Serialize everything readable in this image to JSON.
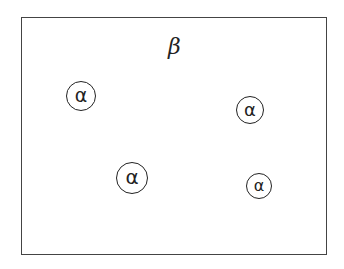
{
  "diagram": {
    "outer_region": {
      "label": "β",
      "x": 21,
      "y": 17,
      "w": 306,
      "h": 238
    },
    "beta_label": {
      "text": "β",
      "cx": 177,
      "cy": 49
    },
    "circles": [
      {
        "label": "α",
        "cx": 81,
        "cy": 96,
        "r": 15
      },
      {
        "label": "α",
        "cx": 250,
        "cy": 110,
        "r": 14
      },
      {
        "label": "α",
        "cx": 132,
        "cy": 178,
        "r": 16
      },
      {
        "label": "α",
        "cx": 259,
        "cy": 186,
        "r": 13
      }
    ],
    "colors": {
      "stroke": "#222222",
      "background": "#ffffff"
    }
  }
}
